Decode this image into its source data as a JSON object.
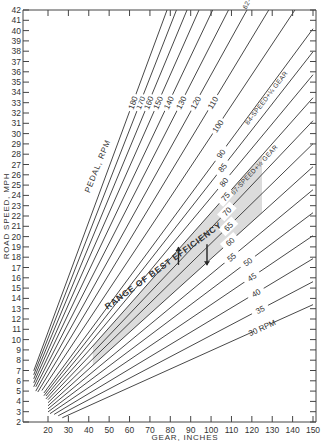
{
  "chart_data": {
    "type": "line",
    "title": "",
    "xlabel": "GEAR, INCHES",
    "ylabel": "ROAD SPEED, MPH",
    "xlim": [
      12,
      150
    ],
    "ylim": [
      2,
      42
    ],
    "x_ticks": [
      20,
      30,
      40,
      50,
      60,
      70,
      80,
      90,
      100,
      110,
      120,
      130,
      140,
      150
    ],
    "y_ticks": [
      2,
      3,
      4,
      5,
      6,
      7,
      8,
      9,
      10,
      11,
      12,
      13,
      14,
      15,
      16,
      17,
      18,
      19,
      20,
      21,
      22,
      23,
      24,
      25,
      26,
      27,
      28,
      29,
      30,
      31,
      32,
      33,
      34,
      35,
      36,
      37,
      38,
      39,
      40,
      41,
      42
    ],
    "grid": false,
    "series_title": "PEDAL, RPM",
    "formula": "speed_mph = gear_in * rpm / 336",
    "series": [
      {
        "name": "30 RPM",
        "rpm": 30,
        "label": "30 RPM",
        "start_gear": 27
      },
      {
        "name": "35",
        "rpm": 35,
        "label": "35",
        "start_gear": 25
      },
      {
        "name": "40",
        "rpm": 40,
        "label": "40",
        "start_gear": 23
      },
      {
        "name": "45",
        "rpm": 45,
        "label": "45",
        "start_gear": 21
      },
      {
        "name": "50",
        "rpm": 50,
        "label": "50",
        "start_gear": 20
      },
      {
        "name": "55",
        "rpm": 55,
        "label": "55",
        "start_gear": 20
      },
      {
        "name": "60",
        "rpm": 60,
        "label": "60",
        "start_gear": 20
      },
      {
        "name": "65",
        "rpm": 65,
        "label": "65",
        "start_gear": 20
      },
      {
        "name": "70",
        "rpm": 70,
        "label": "70",
        "start_gear": 20
      },
      {
        "name": "75",
        "rpm": 75,
        "label": "75",
        "start_gear": 19
      },
      {
        "name": "80",
        "rpm": 80,
        "label": "80",
        "start_gear": 19
      },
      {
        "name": "85",
        "rpm": 85,
        "label": "85",
        "start_gear": 18
      },
      {
        "name": "90",
        "rpm": 90,
        "label": "90",
        "start_gear": 18
      },
      {
        "name": "100",
        "rpm": 100,
        "label": "100",
        "start_gear": 17
      },
      {
        "name": "110",
        "rpm": 110,
        "label": "110",
        "start_gear": 15
      },
      {
        "name": "120",
        "rpm": 120,
        "label": "120",
        "start_gear": 14
      },
      {
        "name": "130",
        "rpm": 130,
        "label": "130",
        "start_gear": 14
      },
      {
        "name": "140",
        "rpm": 140,
        "label": "140",
        "start_gear": 13
      },
      {
        "name": "150",
        "rpm": 150,
        "label": "150",
        "start_gear": 13
      },
      {
        "name": "160",
        "rpm": 160,
        "label": "160",
        "start_gear": 13
      },
      {
        "name": "170",
        "rpm": 170,
        "label": "170",
        "start_gear": 13
      },
      {
        "name": "180",
        "rpm": 180,
        "label": "180",
        "start_gear": 13
      }
    ],
    "annotations": [
      {
        "text": "62-SPEED+½ GEAR",
        "rpm_line": 120,
        "gear": 125
      },
      {
        "text": "84-SPEED+¼ GEAR",
        "rpm_line": 87,
        "gear": 128
      },
      {
        "text": "67-SPEED+½ GEAR",
        "rpm_line": 72,
        "gear": 122
      }
    ],
    "band": {
      "label": "RANGE OF BEST EFFICIENCY",
      "rpm_low": 60,
      "rpm_high": 75,
      "gear_from": 42,
      "gear_to": 125
    }
  }
}
